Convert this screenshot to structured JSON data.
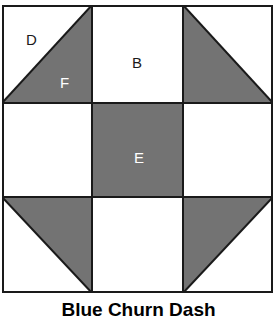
{
  "figure": {
    "caption": "Blue Churn Dash",
    "colors": {
      "background": "#ffffff",
      "patch_light": "#ffffff",
      "patch_dark": "#737373",
      "outline": "#1a1a1a",
      "label_on_light": "#1a1a1a",
      "label_on_dark": "#ffffff"
    },
    "block": {
      "grid": "3x3",
      "patches": [
        {
          "id": "D",
          "label": "D",
          "row": 1,
          "column": 1,
          "shape": "triangle",
          "fill": "light",
          "corner": "upper-left"
        },
        {
          "id": "F",
          "label": "F",
          "row": 1,
          "column": 1,
          "shape": "triangle",
          "fill": "dark",
          "corner": "lower-right"
        },
        {
          "id": "B",
          "label": "B",
          "row": 1,
          "column": 2,
          "shape": "square",
          "fill": "light",
          "corner": ""
        },
        {
          "id": "E",
          "label": "E",
          "row": 2,
          "column": 2,
          "shape": "square",
          "fill": "dark",
          "corner": ""
        }
      ],
      "unlabeled_patches": [
        {
          "row": 1,
          "column": 3,
          "shape": "triangle",
          "fill": "dark",
          "corner": "lower-left"
        },
        {
          "row": 1,
          "column": 3,
          "shape": "triangle",
          "fill": "light",
          "corner": "upper-right"
        },
        {
          "row": 2,
          "column": 1,
          "shape": "square",
          "fill": "light",
          "corner": ""
        },
        {
          "row": 2,
          "column": 3,
          "shape": "square",
          "fill": "light",
          "corner": ""
        },
        {
          "row": 3,
          "column": 1,
          "shape": "triangle",
          "fill": "dark",
          "corner": "upper-right"
        },
        {
          "row": 3,
          "column": 1,
          "shape": "triangle",
          "fill": "light",
          "corner": "lower-left"
        },
        {
          "row": 3,
          "column": 2,
          "shape": "square",
          "fill": "light",
          "corner": ""
        },
        {
          "row": 3,
          "column": 3,
          "shape": "triangle",
          "fill": "dark",
          "corner": "upper-left"
        },
        {
          "row": 3,
          "column": 3,
          "shape": "triangle",
          "fill": "light",
          "corner": "lower-right"
        }
      ]
    },
    "labels": {
      "D": "D",
      "F": "F",
      "B": "B",
      "E": "E"
    }
  }
}
